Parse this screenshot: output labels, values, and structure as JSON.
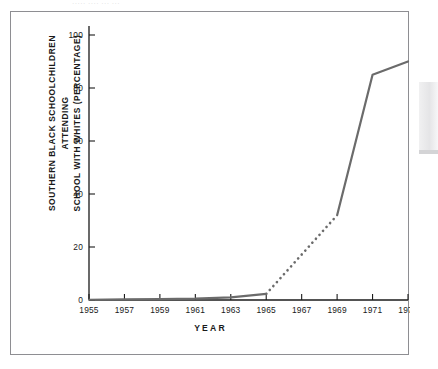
{
  "figure": {
    "caption_remnant": "····· ···· ··· ···",
    "ylabel_text": "SOUTHERN BLACK SCHOOLCHILDREN ATTENDING\nSCHOOL WITH WHITES (PERCENTAGE)",
    "xlabel_text": "YEAR"
  },
  "colors": {
    "line": "#6b6b6b",
    "axis": "#1a1a1a",
    "frame": "#8e8e92",
    "background": "#ffffff",
    "text": "#1a1a1a"
  },
  "chart_data": {
    "type": "line",
    "title": "",
    "subtitle": "",
    "xlabel": "YEAR",
    "ylabel": "SOUTHERN BLACK SCHOOLCHILDREN ATTENDING SCHOOL WITH WHITES (PERCENTAGE)",
    "xlim": [
      1955,
      1973
    ],
    "ylim": [
      0,
      100
    ],
    "xticks": [
      1955,
      1957,
      1959,
      1961,
      1963,
      1965,
      1967,
      1969,
      1971,
      1973
    ],
    "xticklabels": [
      "1955",
      "1957",
      "1959",
      "1961",
      "1963",
      "1965",
      "1967",
      "1969",
      "1971",
      "1973"
    ],
    "yticks": [
      0,
      20,
      40,
      60,
      80,
      100
    ],
    "yticklabels": [
      "0",
      "20",
      "40",
      "60",
      "80",
      "100"
    ],
    "grid": false,
    "legend": null,
    "series": [
      {
        "name": "Southern black schoolchildren attending school with whites",
        "style": "solid",
        "x": [
          1955,
          1957,
          1959,
          1961,
          1963,
          1965
        ],
        "values": [
          0.1,
          0.2,
          0.3,
          0.5,
          1.0,
          2.3
        ]
      },
      {
        "name": "Southern black schoolchildren attending school with whites (interpolated)",
        "style": "dotted",
        "x": [
          1965,
          1969
        ],
        "values": [
          2.3,
          32
        ]
      },
      {
        "name": "Southern black schoolchildren attending school with whites (post-1969)",
        "style": "solid",
        "x": [
          1969,
          1971,
          1973
        ],
        "values": [
          32,
          85,
          90
        ]
      }
    ],
    "annotations": []
  }
}
